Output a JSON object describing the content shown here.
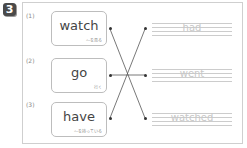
{
  "exercise": {
    "number": "3",
    "items": [
      {
        "label": "(1)",
        "word": "watch",
        "meaning": "～を見る"
      },
      {
        "label": "(2)",
        "word": "go",
        "meaning": "行く"
      },
      {
        "label": "(3)",
        "word": "have",
        "meaning": "～を持っている"
      }
    ],
    "answers": [
      "had",
      "went",
      "watched"
    ],
    "connections": [
      {
        "from": "watch",
        "to": "watched"
      },
      {
        "from": "go",
        "to": "went"
      },
      {
        "from": "have",
        "to": "had"
      }
    ]
  }
}
